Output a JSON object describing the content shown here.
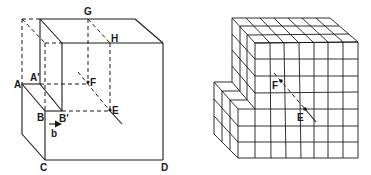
{
  "figure": {
    "left_diagram": {
      "description": "Continuum edge dislocation model: cube with slipped region, Burgers vector b",
      "labels": {
        "A": "A",
        "A_prime": "A'",
        "B": "B",
        "B_prime": "B'",
        "b": "b",
        "C": "C",
        "D": "D",
        "E": "E",
        "F": "F",
        "G": "G",
        "H": "H"
      },
      "colors": {
        "line": "#1a1a1a",
        "background": "#ffffff"
      }
    },
    "right_diagram": {
      "description": "Atomic lattice (cube grid) view of the same dislocation with line EF",
      "labels": {
        "E": "E",
        "F": "F"
      },
      "grid": {
        "front_columns": 7,
        "front_rows": 7,
        "depth_cubes": 3
      },
      "colors": {
        "line": "#1a1a1a",
        "background": "#ffffff"
      }
    }
  }
}
